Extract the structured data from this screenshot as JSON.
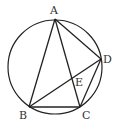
{
  "diagram": {
    "type": "geometry",
    "colors": {
      "stroke": "#222222",
      "label": "#333333",
      "background": "#ffffff"
    },
    "circle": {
      "cx": 55,
      "cy": 67,
      "r": 47
    },
    "points": {
      "A": {
        "x": 55,
        "y": 19,
        "label": "A",
        "lx": 50,
        "ly": 14
      },
      "B": {
        "x": 29,
        "y": 107,
        "label": "B",
        "lx": 19,
        "ly": 119
      },
      "C": {
        "x": 80,
        "y": 107,
        "label": "C",
        "lx": 82,
        "ly": 119
      },
      "D": {
        "x": 101,
        "y": 59,
        "label": "D",
        "lx": 103,
        "ly": 63
      },
      "E": {
        "x": 72,
        "y": 79,
        "label": "E",
        "lx": 75,
        "ly": 86
      }
    },
    "segments": [
      [
        "A",
        "B"
      ],
      [
        "B",
        "C"
      ],
      [
        "C",
        "D"
      ],
      [
        "D",
        "A"
      ],
      [
        "A",
        "C"
      ],
      [
        "B",
        "D"
      ]
    ]
  }
}
